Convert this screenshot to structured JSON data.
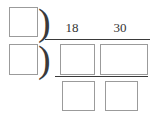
{
  "worksheet": {
    "type": "nested-long-division",
    "description": "Two-level long division (successive division) template with blank answer boxes",
    "width": 154,
    "height": 116,
    "background_color": "#ffffff",
    "box_border_color": "#9b9b9b",
    "rule_color": "#3a3a3a",
    "numeral_color": "#333333"
  },
  "dividend": {
    "digits": [
      {
        "name": "18",
        "value": "18"
      },
      {
        "name": "30",
        "value": "30"
      }
    ]
  },
  "brackets": {
    "outer": ")",
    "inner": ")"
  },
  "blanks": {
    "quotient_outer": "",
    "quotient_inner": "",
    "dividend_left": "",
    "dividend_right": "",
    "remainder_left": "",
    "remainder_right": ""
  }
}
